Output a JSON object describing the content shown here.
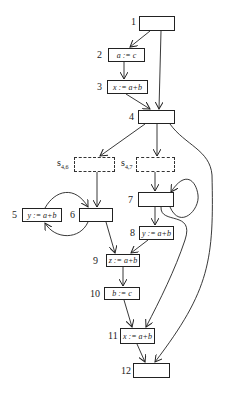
{
  "nodes": {
    "n1": {
      "label": "1",
      "code": ""
    },
    "n2": {
      "label": "2",
      "code": "a := c"
    },
    "n3": {
      "label": "3",
      "code": "x := a+b"
    },
    "n4": {
      "label": "4",
      "code": ""
    },
    "s46": {
      "label": "s",
      "sub": "4,6",
      "code": ""
    },
    "s47": {
      "label": "s",
      "sub": "4,7",
      "code": ""
    },
    "n5": {
      "label": "5",
      "code": "y := a+b"
    },
    "n6": {
      "label": "6",
      "code": ""
    },
    "n7": {
      "label": "7",
      "code": ""
    },
    "n8": {
      "label": "8",
      "code": "y := a+b"
    },
    "n9": {
      "label": "9",
      "code": "z := a+b"
    },
    "n10": {
      "label": "10",
      "code": "b := c"
    },
    "n11": {
      "label": "11",
      "code": "x := a+b"
    },
    "n12": {
      "label": "12",
      "code": ""
    }
  },
  "edges": [
    [
      "1",
      "2"
    ],
    [
      "1",
      "4"
    ],
    [
      "2",
      "3"
    ],
    [
      "3",
      "4"
    ],
    [
      "4",
      "s4,6"
    ],
    [
      "4",
      "s4,7"
    ],
    [
      "4",
      "12"
    ],
    [
      "s4,6",
      "6"
    ],
    [
      "s4,7",
      "7"
    ],
    [
      "6",
      "5"
    ],
    [
      "5",
      "6"
    ],
    [
      "6",
      "9"
    ],
    [
      "7",
      "7"
    ],
    [
      "7",
      "8"
    ],
    [
      "7",
      "11"
    ],
    [
      "8",
      "9"
    ],
    [
      "9",
      "10"
    ],
    [
      "10",
      "11"
    ],
    [
      "11",
      "12"
    ]
  ],
  "colors": {
    "stroke": "#222222",
    "background": "#ffffff"
  }
}
